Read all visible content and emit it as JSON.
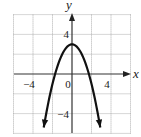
{
  "chart_data": {
    "type": "line",
    "title": "",
    "function": "y = -x^2 + 3",
    "xlabel": "x",
    "ylabel": "y",
    "xlim": [
      -6,
      6
    ],
    "ylim": [
      -6,
      6
    ],
    "grid": true,
    "grid_step": 2,
    "x_ticks": [
      {
        "value": -4,
        "label": "−4"
      },
      {
        "value": 0,
        "label": "0"
      },
      {
        "value": 4,
        "label": "4"
      }
    ],
    "y_ticks": [
      {
        "value": 4,
        "label": "4"
      },
      {
        "value": -4,
        "label": "−4"
      }
    ],
    "series": [
      {
        "name": "parabola",
        "color": "#111111",
        "arrows_at_ends": true,
        "x": [
          -2.9,
          -2.5,
          -2,
          -1.5,
          -1,
          -0.5,
          0,
          0.5,
          1,
          1.5,
          2,
          2.5,
          2.9
        ],
        "values": [
          -5.41,
          -3.25,
          -1,
          0.75,
          2,
          2.75,
          3,
          2.75,
          2,
          0.75,
          -1,
          -3.25,
          -5.41
        ]
      }
    ],
    "key_points": {
      "vertex": [
        0,
        3
      ],
      "x_intercepts": [
        -1.73,
        1.73
      ]
    }
  },
  "colors": {
    "axis": "#333333",
    "grid": "#9a9a9a",
    "curve": "#111111"
  }
}
